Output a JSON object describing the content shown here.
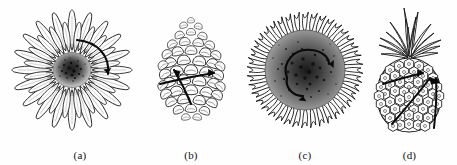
{
  "figure": {
    "background_color": "#fefefe",
    "ink_color": "#111111",
    "width": 457,
    "height": 165,
    "panel_count": 4
  },
  "panels": [
    {
      "label": "(a)",
      "subject": "daisy-flower",
      "subject_name": "Daisy",
      "description": "Composite flower head with two rings of elongated ray petals radiating from a dark stippled central disk",
      "petal_count": 34,
      "center_color": "#2b2b2b",
      "arrow_count": 1,
      "arrow_kind": "single-curved-arc",
      "arrow_direction": "clockwise",
      "icon": "daisy-icon"
    },
    {
      "label": "(b)",
      "subject": "pine-cone",
      "subject_name": "Pine cone",
      "description": "Ovoid pine cone built from overlapping woody scales arranged in intersecting spirals",
      "scale_rows": 9,
      "arrow_count": 2,
      "arrow_kind": "two-crossing-straight-arrows",
      "arrow_direction": "up-left and right",
      "icon": "pine-cone-icon"
    },
    {
      "label": "(c)",
      "subject": "sunflower-head",
      "subject_name": "Sunflower",
      "description": "Sunflower capitulum with a dense dark stippled seed disk ringed by ragged spiky ray florets",
      "ray_count": 46,
      "center_color": "#1f1f1f",
      "arrow_count": 1,
      "arrow_kind": "single-spiral-arc",
      "arrow_direction": "counter-clockwise spiral",
      "icon": "sunflower-icon"
    },
    {
      "label": "(d)",
      "subject": "pineapple",
      "subject_name": "Pineapple",
      "description": "Upright pineapple fruit with hexagonal scale tiling and a spray of crown leaves",
      "crown_leaf_count": 16,
      "arrow_count": 2,
      "arrow_kind": "two-crossing-straight-arrows",
      "arrow_direction": "up-right and up",
      "icon": "pineapple-icon"
    }
  ]
}
